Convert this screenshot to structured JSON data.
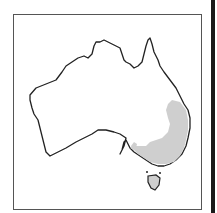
{
  "map": {
    "region": "Australia",
    "type": "species distribution map",
    "highlighted_area": "south-eastern Australia (eastern Queensland, New South Wales, Victoria, south-east South Australia)",
    "colors": {
      "land": "#ffffff",
      "coastline": "#222222",
      "distribution": "#cfcfcf",
      "frame": "#555555"
    }
  }
}
